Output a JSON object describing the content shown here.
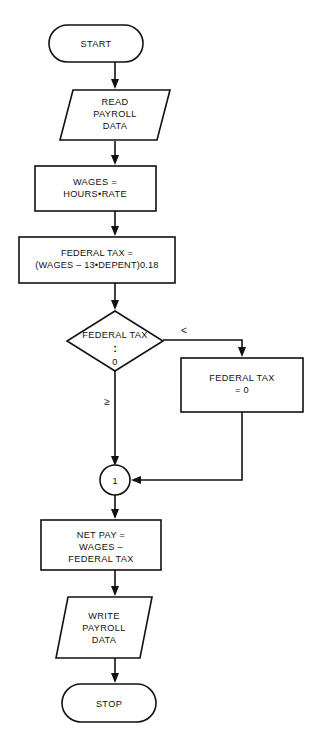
{
  "diagram": {
    "type": "flowchart",
    "background_color": "#ffffff",
    "line_color": "#111111"
  },
  "nodes": {
    "start": {
      "shape": "terminal",
      "label": "START"
    },
    "read_payroll": {
      "shape": "parallelogram",
      "line1": "READ",
      "line2": "PAYROLL",
      "line3": "DATA"
    },
    "wages": {
      "shape": "process",
      "line1": "WAGES =",
      "line2": "HOURS•RATE"
    },
    "federal_tax_calc": {
      "shape": "process",
      "line1": "FEDERAL TAX =",
      "line2": "(WAGES – 13•DEPENT)0.18"
    },
    "decision": {
      "shape": "diamond",
      "line1": "FEDERAL TAX",
      "operator": ":",
      "line2": "0"
    },
    "federal_tax_zero": {
      "shape": "process",
      "line1": "FEDERAL TAX",
      "line2": "= 0"
    },
    "connector": {
      "shape": "circle",
      "label": "1"
    },
    "net_pay": {
      "shape": "process",
      "line1": "NET PAY  =",
      "line2": "WAGES –",
      "line3": "FEDERAL TAX"
    },
    "write_payroll": {
      "shape": "parallelogram",
      "line1": "WRITE",
      "line2": "PAYROLL",
      "line3": "DATA"
    },
    "stop": {
      "shape": "terminal",
      "label": "STOP"
    }
  },
  "branch_labels": {
    "less_than": "<",
    "greater_or_equal": "≥"
  }
}
